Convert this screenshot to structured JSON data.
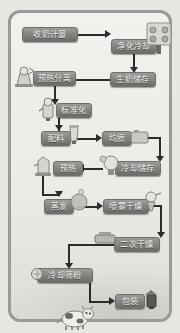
{
  "diagram": {
    "type": "process-flowchart",
    "orientation": "top-to-bottom serpentine",
    "frame_color": "#9a9a98",
    "node_fill": "#868481",
    "node_text_color": "#f4f3f0",
    "connector_color": "#2c2c2c",
    "background": "#ebeae5",
    "nodes": [
      {
        "id": "n1",
        "label": "收奶计量",
        "row": 1
      },
      {
        "id": "n2",
        "label": "净化冷却",
        "row": 1
      },
      {
        "id": "n3",
        "label": "生奶储存",
        "row": 2
      },
      {
        "id": "n4",
        "label": "预热分离",
        "row": 2
      },
      {
        "id": "n5",
        "label": "标准化",
        "row": 3
      },
      {
        "id": "n6",
        "label": "配料",
        "row": 4
      },
      {
        "id": "n7",
        "label": "均质",
        "row": 4
      },
      {
        "id": "n8",
        "label": "冷却储存",
        "row": 5
      },
      {
        "id": "n9",
        "label": "预热",
        "row": 5
      },
      {
        "id": "n10",
        "label": "蒸发",
        "row": 6
      },
      {
        "id": "n11",
        "label": "喷雾干燥",
        "row": 6
      },
      {
        "id": "n12",
        "label": "二次干燥",
        "row": 7
      },
      {
        "id": "n13",
        "label": "冷却筛粉",
        "row": 8
      },
      {
        "id": "n14",
        "label": "包装",
        "row": 9
      }
    ],
    "edges": [
      {
        "from": "收奶计量",
        "to": "净化冷却",
        "direction": "right"
      },
      {
        "from": "净化冷却",
        "to": "生奶储存",
        "direction": "down"
      },
      {
        "from": "生奶储存",
        "to": "预热分离",
        "direction": "left"
      },
      {
        "from": "预热分离",
        "to": "标准化",
        "direction": "down"
      },
      {
        "from": "标准化",
        "to": "配料",
        "direction": "down"
      },
      {
        "from": "配料",
        "to": "均质",
        "direction": "right"
      },
      {
        "from": "均质",
        "to": "冷却储存",
        "direction": "down"
      },
      {
        "from": "冷却储存",
        "to": "预热",
        "direction": "left"
      },
      {
        "from": "预热",
        "to": "蒸发",
        "direction": "down"
      },
      {
        "from": "蒸发",
        "to": "喷雾干燥",
        "direction": "right"
      },
      {
        "from": "喷雾干燥",
        "to": "二次干燥",
        "direction": "down"
      },
      {
        "from": "二次干燥",
        "to": "冷却筛粉",
        "direction": "left"
      },
      {
        "from": "冷却筛粉",
        "to": "包装",
        "direction": "down"
      }
    ],
    "decorations": [
      {
        "name": "centrifuge-separator-icon",
        "near": "净化冷却"
      },
      {
        "name": "separator-machine-icon",
        "near": "预热分离"
      },
      {
        "name": "standardizer-tank-icon",
        "near": "标准化"
      },
      {
        "name": "mixing-tank-icon",
        "near": "配料"
      },
      {
        "name": "heat-exchanger-icon",
        "near": "预热"
      },
      {
        "name": "storage-tank-icon",
        "near": "冷却储存"
      },
      {
        "name": "evaporator-icon",
        "near": "蒸发"
      },
      {
        "name": "spray-dryer-icon",
        "near": "喷雾干燥"
      },
      {
        "name": "fluid-bed-dryer-icon",
        "near": "二次干燥"
      },
      {
        "name": "sieve-icon",
        "near": "冷却筛粉"
      },
      {
        "name": "packaging-machine-icon",
        "near": "包装"
      },
      {
        "name": "dairy-cow-illustration",
        "near": "bottom"
      }
    ]
  }
}
